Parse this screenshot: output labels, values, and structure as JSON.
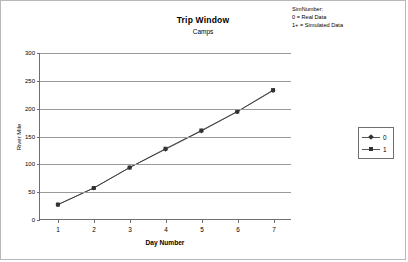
{
  "chart_data": {
    "type": "line",
    "title": "Trip Window",
    "subtitle": "Camps",
    "xlabel": "Day Number",
    "ylabel": "River Mile",
    "x": [
      1,
      2,
      3,
      4,
      5,
      6,
      7
    ],
    "xlim": [
      0.5,
      7.5
    ],
    "ylim": [
      0,
      300
    ],
    "yticks": [
      0,
      50,
      100,
      150,
      200,
      250,
      300
    ],
    "xticks": [
      1,
      2,
      3,
      4,
      5,
      6,
      7
    ],
    "grid": "horizontal",
    "legend_position": "right",
    "series": [
      {
        "name": "0",
        "marker": "diamond",
        "color": "#333333",
        "values": [
          26,
          56,
          93,
          126,
          159,
          194,
          232
        ]
      },
      {
        "name": "1",
        "marker": "square",
        "color": "#333333",
        "values": [
          26,
          56,
          93,
          127,
          160,
          194,
          233
        ]
      }
    ],
    "annotations": [
      "SimNumber:",
      "0 = Real Data",
      "1+ = Simulated Data"
    ]
  },
  "legend": {
    "entries": [
      {
        "label": "0"
      },
      {
        "label": "1"
      }
    ]
  },
  "note": {
    "line1": "SimNumber:",
    "line2": "0 = Real Data",
    "line3": "1+ = Simulated Data"
  },
  "axis": {
    "y_labels": [
      "300",
      "250",
      "200",
      "150",
      "100",
      "50",
      "0"
    ],
    "x_labels": [
      "1",
      "2",
      "3",
      "4",
      "5",
      "6",
      "7"
    ]
  }
}
